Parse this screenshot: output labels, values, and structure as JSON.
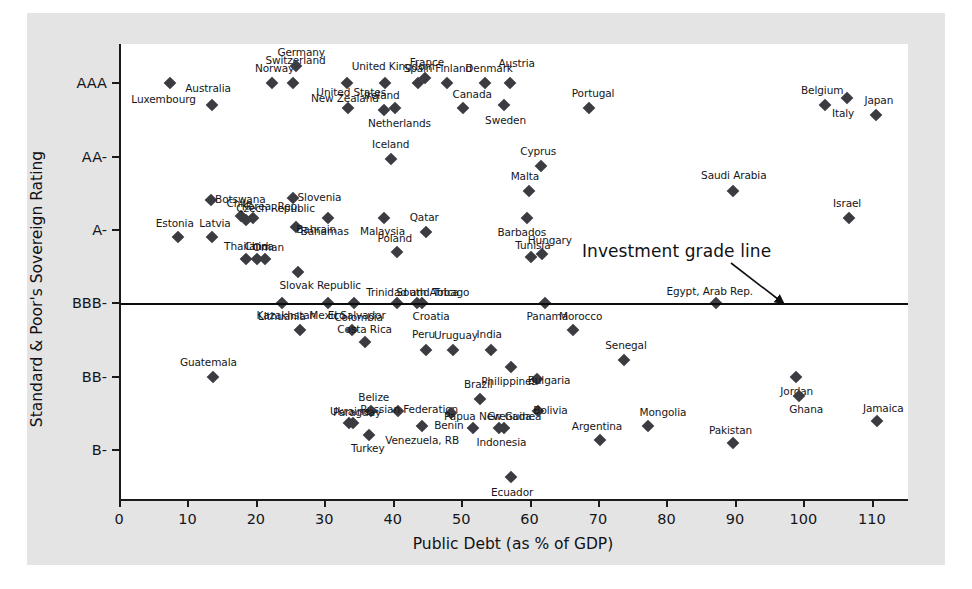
{
  "chart_data": {
    "type": "scatter",
    "title": "",
    "xlabel": "Public Debt (as % of GDP)",
    "ylabel": "Standard & Poor's Sovereign Rating",
    "xlim": [
      0,
      115
    ],
    "ylim": [
      0.5,
      9.8
    ],
    "grid": false,
    "legend": "none",
    "xticks": [
      0,
      10,
      20,
      30,
      40,
      50,
      60,
      70,
      80,
      90,
      100,
      110
    ],
    "yticks": [
      {
        "label": "AAA",
        "value": 9.0
      },
      {
        "label": "AA-",
        "value": 7.5
      },
      {
        "label": "A-",
        "value": 6.0
      },
      {
        "label": "BBB-",
        "value": 4.5
      },
      {
        "label": "BB-",
        "value": 3.0
      },
      {
        "label": "B-",
        "value": 1.5
      }
    ],
    "annotations": [
      {
        "name": "investment-grade-line",
        "text": "Investment grade line",
        "y_value": 4.5
      }
    ],
    "marker_color": "#3b3b42",
    "points": [
      {
        "label": "Luxembourg",
        "x": 7.1,
        "y": 9.0,
        "lx": -6,
        "ly": 16
      },
      {
        "label": "Australia",
        "x": 13.3,
        "y": 8.55,
        "lx": -4,
        "ly": -17
      },
      {
        "label": "Norway",
        "x": 22.0,
        "y": 9.0,
        "lx": 3,
        "ly": -15
      },
      {
        "label": "Switzerland",
        "x": 25.2,
        "y": 9.0,
        "lx": 2,
        "ly": -23
      },
      {
        "label": "Germany",
        "x": 25.6,
        "y": 9.35,
        "lx": 5,
        "ly": -14
      },
      {
        "label": "New Zealand",
        "x": 33.0,
        "y": 9.0,
        "lx": -2,
        "ly": 15
      },
      {
        "label": "United States",
        "x": 33.2,
        "y": 8.5,
        "lx": 3,
        "ly": -16
      },
      {
        "label": "United Kingdom",
        "x": 38.6,
        "y": 9.0,
        "lx": 8,
        "ly": -17
      },
      {
        "label": "Ireland",
        "x": 38.4,
        "y": 8.45,
        "lx": -2,
        "ly": -15
      },
      {
        "label": "Netherlands",
        "x": 40.1,
        "y": 8.5,
        "lx": 4,
        "ly": 15
      },
      {
        "label": "Spain",
        "x": 43.4,
        "y": 9.0,
        "lx": 0,
        "ly": -15
      },
      {
        "label": "France",
        "x": 44.4,
        "y": 9.1,
        "lx": 2,
        "ly": -16
      },
      {
        "label": "Finland",
        "x": 47.6,
        "y": 9.0,
        "lx": 7,
        "ly": -15
      },
      {
        "label": "Canada",
        "x": 50.0,
        "y": 8.5,
        "lx": 9,
        "ly": -14
      },
      {
        "label": "Denmark",
        "x": 53.2,
        "y": 9.0,
        "lx": 4,
        "ly": -15
      },
      {
        "label": "Austria",
        "x": 56.8,
        "y": 9.0,
        "lx": 7,
        "ly": -20
      },
      {
        "label": "Sweden",
        "x": 55.9,
        "y": 8.55,
        "lx": 2,
        "ly": 15
      },
      {
        "label": "Portugal",
        "x": 68.4,
        "y": 8.5,
        "lx": 4,
        "ly": -15
      },
      {
        "label": "Belgium",
        "x": 102.9,
        "y": 8.55,
        "lx": -3,
        "ly": -15
      },
      {
        "label": "Italy",
        "x": 106.1,
        "y": 8.7,
        "lx": -4,
        "ly": 15
      },
      {
        "label": "Japan",
        "x": 110.3,
        "y": 8.35,
        "lx": 3,
        "ly": -15
      },
      {
        "label": "Iceland",
        "x": 39.4,
        "y": 7.45,
        "lx": 0,
        "ly": -15
      },
      {
        "label": "Cyprus",
        "x": 61.4,
        "y": 7.3,
        "lx": -3,
        "ly": -15
      },
      {
        "label": "Malta",
        "x": 59.6,
        "y": 6.8,
        "lx": -4,
        "ly": -15
      },
      {
        "label": "Saudi Arabia",
        "x": 89.4,
        "y": 6.8,
        "lx": 1,
        "ly": -16
      },
      {
        "label": "Israel",
        "x": 106.4,
        "y": 6.25,
        "lx": -2,
        "ly": -15
      },
      {
        "label": "Botswana",
        "x": 13.2,
        "y": 6.62,
        "lx": 29,
        "ly": -1
      },
      {
        "label": "Chile",
        "x": 17.6,
        "y": 6.28,
        "lx": -2,
        "ly": -13
      },
      {
        "label": "Czech Republic",
        "x": 18.2,
        "y": 6.2,
        "lx": 30,
        "ly": -12
      },
      {
        "label": "Korea, Rep.",
        "x": 19.3,
        "y": 6.25,
        "lx": 18,
        "ly": -12
      },
      {
        "label": "Slovenia",
        "x": 25.2,
        "y": 6.65,
        "lx": 26,
        "ly": -1
      },
      {
        "label": "Estonia",
        "x": 8.3,
        "y": 5.85,
        "lx": -3,
        "ly": -14
      },
      {
        "label": "Latvia",
        "x": 13.3,
        "y": 5.85,
        "lx": 3,
        "ly": -14
      },
      {
        "label": "Bahrain",
        "x": 25.6,
        "y": 6.05,
        "lx": 20,
        "ly": 2
      },
      {
        "label": "Bahamas",
        "x": 30.2,
        "y": 6.25,
        "lx": -3,
        "ly": 13
      },
      {
        "label": "Malaysia",
        "x": 38.5,
        "y": 6.25,
        "lx": -2,
        "ly": 13
      },
      {
        "label": "Qatar",
        "x": 44.6,
        "y": 5.95,
        "lx": -2,
        "ly": -15
      },
      {
        "label": "Barbados",
        "x": 59.3,
        "y": 6.25,
        "lx": -5,
        "ly": 14
      },
      {
        "label": "Thailand",
        "x": 18.3,
        "y": 5.4,
        "lx": 0,
        "ly": -13
      },
      {
        "label": "China",
        "x": 19.9,
        "y": 5.4,
        "lx": 2,
        "ly": -13
      },
      {
        "label": "Oman",
        "x": 21.1,
        "y": 5.4,
        "lx": 3,
        "ly": -12
      },
      {
        "label": "Poland",
        "x": 40.3,
        "y": 5.55,
        "lx": -2,
        "ly": -14
      },
      {
        "label": "Slovak Republic",
        "x": 25.9,
        "y": 5.15,
        "lx": 22,
        "ly": 13
      },
      {
        "label": "Hungary",
        "x": 61.5,
        "y": 5.5,
        "lx": 8,
        "ly": -14
      },
      {
        "label": "Tunisia",
        "x": 59.9,
        "y": 5.45,
        "lx": 2,
        "ly": -12
      },
      {
        "label": "Lithuania",
        "x": 23.5,
        "y": 4.5,
        "lx": 0,
        "ly": 13
      },
      {
        "label": "Mexico",
        "x": 30.3,
        "y": 4.5,
        "lx": -1,
        "ly": 12
      },
      {
        "label": "El Salvador",
        "x": 34.0,
        "y": 4.5,
        "lx": 3,
        "ly": 12
      },
      {
        "label": "Trinidad and Tobago",
        "x": 40.3,
        "y": 4.5,
        "lx": 21,
        "ly": -11
      },
      {
        "label": "South Africa",
        "x": 43.2,
        "y": 4.5,
        "lx": 11,
        "ly": -11
      },
      {
        "label": "Croatia",
        "x": 44.0,
        "y": 4.5,
        "lx": 9,
        "ly": 13
      },
      {
        "label": "Panama",
        "x": 62.0,
        "y": 4.5,
        "lx": 2,
        "ly": 13
      },
      {
        "label": "Egypt, Arab Rep.",
        "x": 86.9,
        "y": 4.5,
        "lx": -6,
        "ly": -12
      },
      {
        "label": "Kazakhstan",
        "x": 26.2,
        "y": 3.95,
        "lx": -14,
        "ly": -15
      },
      {
        "label": "Colombia",
        "x": 33.7,
        "y": 3.95,
        "lx": 7,
        "ly": -13
      },
      {
        "label": "Costa Rica",
        "x": 35.6,
        "y": 3.7,
        "lx": 0,
        "ly": -13
      },
      {
        "label": "Peru",
        "x": 44.5,
        "y": 3.55,
        "lx": -2,
        "ly": -16
      },
      {
        "label": "Uruguay",
        "x": 48.5,
        "y": 3.55,
        "lx": 3,
        "ly": -15
      },
      {
        "label": "India",
        "x": 54.1,
        "y": 3.55,
        "lx": -2,
        "ly": -16
      },
      {
        "label": "Morocco",
        "x": 66.0,
        "y": 3.95,
        "lx": 8,
        "ly": -14
      },
      {
        "label": "Guatemala",
        "x": 13.5,
        "y": 3.0,
        "lx": -5,
        "ly": -15
      },
      {
        "label": "Philippines",
        "x": 57.0,
        "y": 3.2,
        "lx": -2,
        "ly": 14
      },
      {
        "label": "Bulgaria",
        "x": 60.8,
        "y": 2.95,
        "lx": 12,
        "ly": 1
      },
      {
        "label": "Senegal",
        "x": 73.5,
        "y": 3.35,
        "lx": 2,
        "ly": -15
      },
      {
        "label": "Jordan",
        "x": 98.6,
        "y": 3.0,
        "lx": 1,
        "ly": 14
      },
      {
        "label": "Ghana",
        "x": 99.1,
        "y": 2.6,
        "lx": 7,
        "ly": 13
      },
      {
        "label": "Brazil",
        "x": 52.5,
        "y": 2.55,
        "lx": -2,
        "ly": -15
      },
      {
        "label": "Russian Federation",
        "x": 40.5,
        "y": 2.3,
        "lx": 11,
        "ly": -2
      },
      {
        "label": "Belize",
        "x": 36.5,
        "y": 2.3,
        "lx": 3,
        "ly": -14
      },
      {
        "label": "Ukraine",
        "x": 33.3,
        "y": 2.05,
        "lx": 1,
        "ly": -12
      },
      {
        "label": "Paraguay",
        "x": 33.9,
        "y": 2.05,
        "lx": 4,
        "ly": -11
      },
      {
        "label": "Turkey",
        "x": 36.2,
        "y": 1.8,
        "lx": -1,
        "ly": 13
      },
      {
        "label": "Venezuela, RB",
        "x": 44.0,
        "y": 2.0,
        "lx": 0,
        "ly": 14
      },
      {
        "label": "Benin",
        "x": 48.2,
        "y": 2.25,
        "lx": -2,
        "ly": 12
      },
      {
        "label": "Papua New Guinea",
        "x": 51.4,
        "y": 1.95,
        "lx": 20,
        "ly": -12
      },
      {
        "label": "Grenada",
        "x": 56.0,
        "y": 1.95,
        "lx": 5,
        "ly": -12
      },
      {
        "label": "Bolivia",
        "x": 61.0,
        "y": 2.3,
        "lx": 12,
        "ly": -1
      },
      {
        "label": "Indonesia",
        "x": 55.3,
        "y": 1.95,
        "lx": 2,
        "ly": 14
      },
      {
        "label": "Argentina",
        "x": 70.0,
        "y": 1.7,
        "lx": -3,
        "ly": -14
      },
      {
        "label": "Mongolia",
        "x": 77.0,
        "y": 2.0,
        "lx": 15,
        "ly": -14
      },
      {
        "label": "Pakistan",
        "x": 89.5,
        "y": 1.65,
        "lx": -3,
        "ly": -13
      },
      {
        "label": "Jamaica",
        "x": 110.5,
        "y": 2.1,
        "lx": 6,
        "ly": -13
      },
      {
        "label": "Ecuador",
        "x": 57.0,
        "y": 0.95,
        "lx": 1,
        "ly": 15
      }
    ]
  },
  "axes": {
    "y_title": "Standard & Poor's Sovereign Rating",
    "x_title": "Public Debt (as % of GDP)"
  },
  "annotation": {
    "investment_grade_text": "Investment grade line"
  },
  "colors": {
    "figure_background": "#e4e4e4",
    "plot_background": "#ffffff",
    "marker": "#3b3b42",
    "axis": "#1a1a1a",
    "text": "#16161a"
  }
}
